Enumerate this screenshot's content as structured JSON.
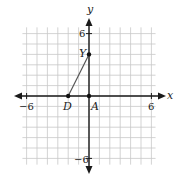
{
  "graph": {
    "x_axis_label": "x",
    "y_axis_label": "y",
    "ticks": {
      "x_neg": "−6",
      "x_pos": "6",
      "y_pos": "6",
      "y_neg": "−6"
    },
    "range": {
      "xmin": -6,
      "xmax": 6,
      "ymin": -6,
      "ymax": 6
    },
    "points": [
      {
        "name": "D",
        "x": -2,
        "y": 0
      },
      {
        "name": "Y",
        "x": 0,
        "y": 4
      },
      {
        "name": "A",
        "x": 0,
        "y": 0
      }
    ],
    "segments": [
      {
        "from": "D",
        "to": "Y"
      }
    ],
    "colors": {
      "grid": "#c8c8c8",
      "axis": "#1a1a1a",
      "segment": "#555555",
      "point": "#111111"
    }
  }
}
